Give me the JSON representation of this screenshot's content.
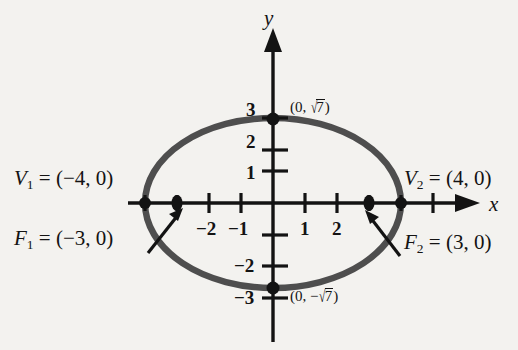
{
  "figure": {
    "type": "ellipse-conic-diagram",
    "background_color": "#f3f2ef",
    "ink_color": "#131313",
    "curve_color": "#4c4c4c"
  },
  "axes": {
    "x_label": "x",
    "y_label": "y",
    "origin_px": [
      273,
      203
    ],
    "unit_px": 32,
    "x_ticks": [
      {
        "value": -2,
        "label": "−2"
      },
      {
        "value": -1,
        "label": "−1"
      },
      {
        "value": 1,
        "label": "1"
      },
      {
        "value": 2,
        "label": "2"
      }
    ],
    "x_ticks_unlabeled": [
      -4,
      -3,
      3,
      4,
      5
    ],
    "y_ticks": [
      {
        "value": 3,
        "label": "3"
      },
      {
        "value": 2,
        "label": "2"
      },
      {
        "value": 1,
        "label": "1"
      },
      {
        "value": -2,
        "label": "−2"
      },
      {
        "value": -3,
        "label": "−3"
      }
    ],
    "y_ticks_unlabeled": [
      -1
    ]
  },
  "curve": {
    "name": "ellipse",
    "semi_major_axis": 4,
    "semi_minor_axis_value": "√7",
    "semi_minor_axis_px": 85,
    "center": [
      0,
      0
    ]
  },
  "labels": {
    "vertex_left": {
      "name": "V",
      "subscript": "1",
      "equals": "=",
      "coords": "(−4, 0)",
      "text": "V₁ = (−4, 0)"
    },
    "vertex_right": {
      "name": "V",
      "subscript": "2",
      "equals": "=",
      "coords": "(4, 0)",
      "text": "V₂ = (4, 0)"
    },
    "focus_left": {
      "name": "F",
      "subscript": "1",
      "equals": "=",
      "coords": "(−3, 0)",
      "text": "F₁ = (−3, 0)"
    },
    "focus_right": {
      "name": "F",
      "subscript": "2",
      "equals": "=",
      "coords": "(3, 0)",
      "text": "F₂ = (3, 0)"
    },
    "covertex_top": {
      "open": "(0, ",
      "radical": "√",
      "radicand": "7",
      "close": ")"
    },
    "covertex_bottom": {
      "open": "(0, −",
      "radical": "√",
      "radicand": "7",
      "close": ")"
    }
  },
  "markers": {
    "vertices": [
      {
        "x": -4,
        "y": 0,
        "kind": "dot"
      },
      {
        "x": 4,
        "y": 0,
        "kind": "dot"
      }
    ],
    "foci": [
      {
        "x": -3,
        "y": 0,
        "kind": "dot"
      },
      {
        "x": 3,
        "y": 0,
        "kind": "dot"
      }
    ],
    "covertices": [
      {
        "x": 0,
        "y": 2.646,
        "kind": "dot"
      },
      {
        "x": 0,
        "y": -2.646,
        "kind": "dot"
      }
    ]
  },
  "annotations": {
    "arrow_to_focus_left": {
      "from_px": [
        152,
        250
      ],
      "to_px": [
        185,
        208
      ]
    },
    "arrow_to_focus_right": {
      "from_px": [
        400,
        253
      ],
      "to_px": [
        367,
        212
      ]
    }
  }
}
